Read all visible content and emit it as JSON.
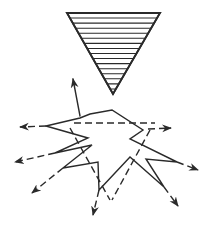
{
  "figure": {
    "description": "Inverted hatched triangle above an irregular starburst with radiating arrows (solid and dashed)",
    "stroke_color": "#2a2a2a",
    "background": "#ffffff",
    "triangle": {
      "points": [
        [
          67,
          13
        ],
        [
          160,
          13
        ],
        [
          113,
          94
        ]
      ],
      "hatch_lines": 15,
      "fill": "horizontal-hatch"
    },
    "starburst": {
      "outline": [
        [
          46,
          126
        ],
        [
          80,
          118
        ],
        [
          90,
          114
        ],
        [
          112,
          110
        ],
        [
          143,
          130
        ],
        [
          130,
          139
        ],
        [
          177,
          162
        ],
        [
          146,
          159
        ],
        [
          164,
          187
        ],
        [
          130,
          157
        ],
        [
          99,
          190
        ],
        [
          98,
          162
        ],
        [
          63,
          168
        ],
        [
          92,
          145
        ],
        [
          55,
          153
        ],
        [
          88,
          138
        ],
        [
          46,
          126
        ]
      ],
      "arrows": [
        {
          "name": "arrow-up",
          "from": [
            80,
            116
          ],
          "to": [
            73,
            79
          ],
          "style": "solid"
        },
        {
          "name": "arrow-left-upper",
          "from": [
            46,
            126
          ],
          "to": [
            20,
            127
          ],
          "style": "dashed"
        },
        {
          "name": "arrow-left-middle",
          "from": [
            55,
            153
          ],
          "to": [
            15,
            162
          ],
          "style": "dashed"
        },
        {
          "name": "arrow-left-lower",
          "from": [
            63,
            168
          ],
          "to": [
            32,
            193
          ],
          "style": "dashed"
        },
        {
          "name": "arrow-bottom",
          "from": [
            99,
            190
          ],
          "to": [
            93,
            215
          ],
          "style": "dashed"
        },
        {
          "name": "arrow-bottom-right",
          "from": [
            164,
            187
          ],
          "to": [
            178,
            206
          ],
          "style": "dashed"
        },
        {
          "name": "arrow-right-lower",
          "from": [
            177,
            162
          ],
          "to": [
            198,
            170
          ],
          "style": "dashed"
        },
        {
          "name": "arrow-right-upper",
          "from": [
            148,
            129
          ],
          "to": [
            171,
            128
          ],
          "style": "dashed"
        }
      ],
      "dashed_lines": [
        {
          "name": "dashed-horizontal",
          "from": [
            74,
            123
          ],
          "to": [
            155,
            123
          ]
        },
        {
          "name": "dashed-diagonal-left",
          "from": [
            70,
            128
          ],
          "to": [
            110,
            200
          ]
        },
        {
          "name": "dashed-diagonal-right",
          "from": [
            150,
            130
          ],
          "to": [
            112,
            200
          ]
        }
      ]
    }
  }
}
